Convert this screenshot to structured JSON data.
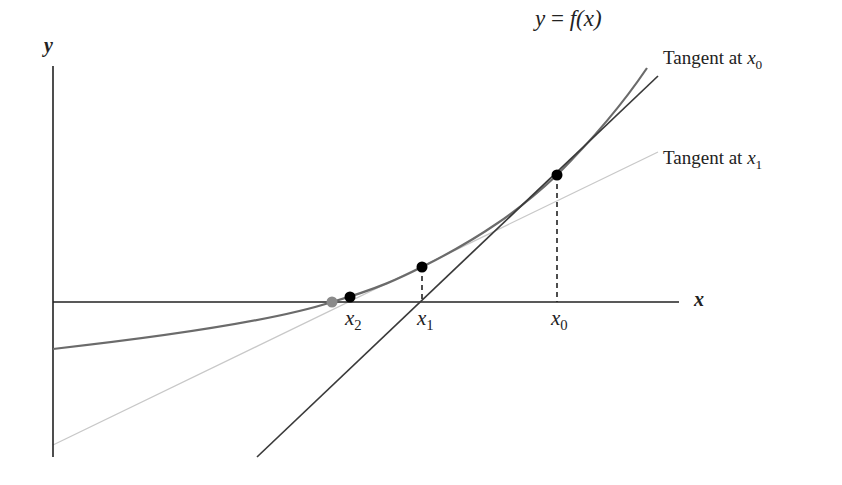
{
  "diagram": {
    "axes": {
      "x_label": "x",
      "y_label": "y"
    },
    "curve": {
      "label": "y = f(x)",
      "label_parts": {
        "lhs": "y",
        "eq": " = ",
        "fn": "f",
        "arg": "(x)"
      }
    },
    "tangents": [
      {
        "label_text": "Tangent at ",
        "var": "x",
        "sub": "0",
        "style": "dark"
      },
      {
        "label_text": "Tangent at ",
        "var": "x",
        "sub": "1",
        "style": "light"
      }
    ],
    "points": [
      {
        "name": "x0",
        "var": "x",
        "sub": "0",
        "dashed_drop": true
      },
      {
        "name": "x1",
        "var": "x",
        "sub": "1",
        "dashed_drop": true
      },
      {
        "name": "x2",
        "var": "x",
        "sub": "2",
        "dashed_drop": false
      },
      {
        "name": "root",
        "color": "gray"
      }
    ],
    "colors": {
      "axis": "#222222",
      "curve": "#6b6b6b",
      "tangent_dark": "#3a3a3a",
      "tangent_light": "#c8c8c8",
      "point": "#000000",
      "root_point": "#8a8a8a"
    }
  }
}
